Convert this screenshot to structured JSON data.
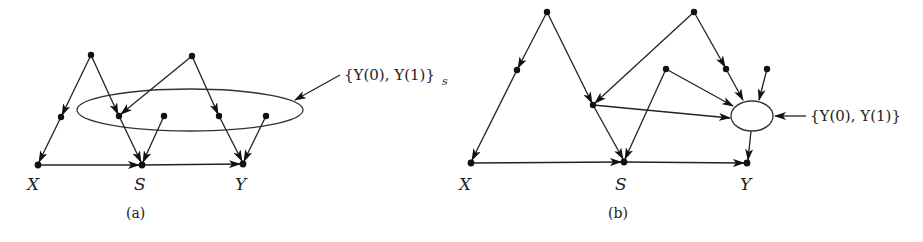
{
  "panels": [
    {
      "id": "a",
      "caption": "(a)",
      "variable_labels": {
        "x": "X",
        "s": "S",
        "y": "Y"
      },
      "set_label": "{Y(0), Y(1)}",
      "set_subscript": "s",
      "set_node_type": "ellipse spanning intermediate nodes"
    },
    {
      "id": "b",
      "caption": "(b)",
      "variable_labels": {
        "x": "X",
        "s": "S",
        "y": "Y"
      },
      "set_label": "{Y(0), Y(1)}",
      "set_node_type": "single oval node"
    }
  ],
  "colors": {
    "ink": "#222222",
    "background": "#ffffff"
  }
}
